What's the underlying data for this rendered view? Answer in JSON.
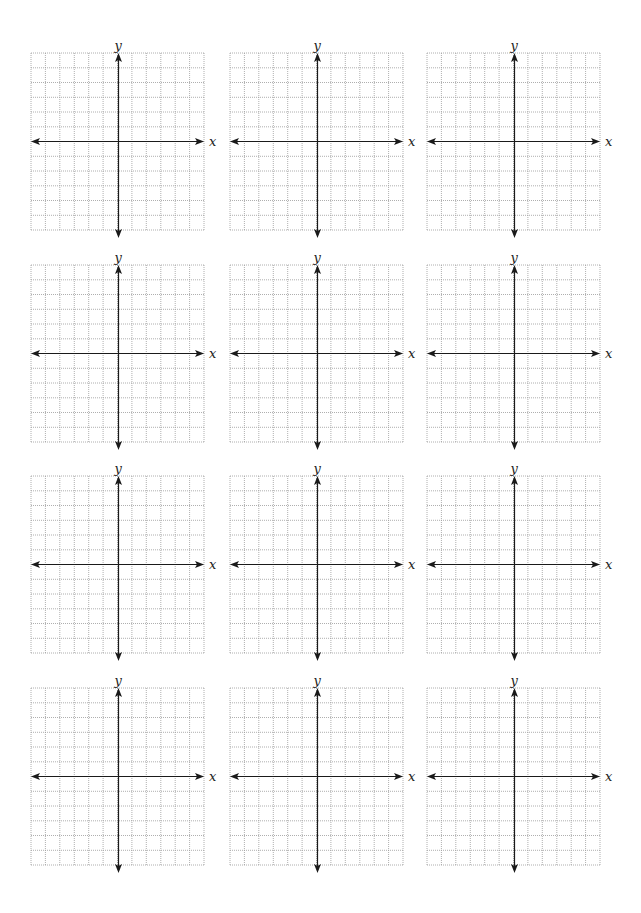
{
  "page": {
    "background": "#ffffff"
  },
  "grid": {
    "rows": 4,
    "cols": 3,
    "cells_x": 12,
    "cells_y": 12,
    "grid_color": "#9a9a9a",
    "axis_color": "#1a1a1a"
  },
  "axis_labels": {
    "x": "x",
    "y": "y"
  },
  "graphs": [
    {
      "row": 1,
      "col": 1
    },
    {
      "row": 1,
      "col": 2
    },
    {
      "row": 1,
      "col": 3
    },
    {
      "row": 2,
      "col": 1
    },
    {
      "row": 2,
      "col": 2
    },
    {
      "row": 2,
      "col": 3
    },
    {
      "row": 3,
      "col": 1
    },
    {
      "row": 3,
      "col": 2
    },
    {
      "row": 3,
      "col": 3
    },
    {
      "row": 4,
      "col": 1
    },
    {
      "row": 4,
      "col": 2
    },
    {
      "row": 4,
      "col": 3
    }
  ]
}
